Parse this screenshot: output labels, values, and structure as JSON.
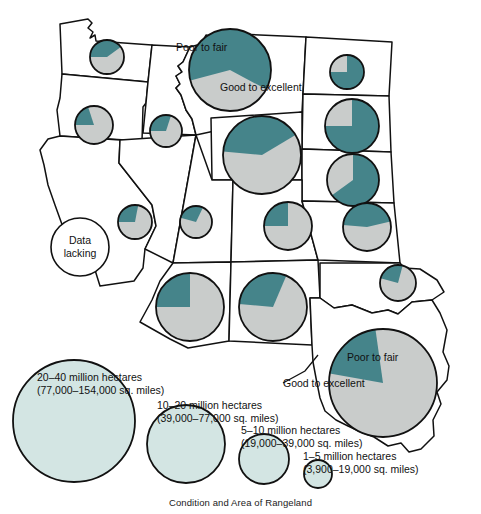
{
  "figure": {
    "caption": "Condition and Area of Rangeland",
    "title_absent": true
  },
  "colors": {
    "good_to_excellent": "#45848a",
    "poor_to_fair": "#c9cccb",
    "legend_circle_fill": "#d3e5e3",
    "outline": "#111111",
    "background": "#ffffff"
  },
  "annotations": {
    "poor_to_fair_montana": "Poor to fair",
    "good_to_excellent_montana": "Good to excellent",
    "poor_to_fair_texas": "Poor to fair",
    "good_to_excellent_texas": "Good to excellent",
    "data_lacking": "Data lacking"
  },
  "legend": {
    "title": "Condition and Area of Rangeland",
    "entries": [
      {
        "id": "legend-20-40",
        "hectares": "20–40 million hectares",
        "sq_miles": "(77,000–154,000 sq. miles)",
        "radius_px": 61
      },
      {
        "id": "legend-10-20",
        "hectares": "10–20 million hectares",
        "sq_miles": "(39,000–77,000 sq. miles)",
        "radius_px": 39
      },
      {
        "id": "legend-5-10",
        "hectares": "5–10 million hectares",
        "sq_miles": "(19,000–39,000 sq. miles)",
        "radius_px": 25
      },
      {
        "id": "legend-1-5",
        "hectares": "1–5 million hectares",
        "sq_miles": "(3,900–19,000 sq. miles)",
        "radius_px": 14
      }
    ]
  },
  "chart_data": {
    "type": "pie",
    "title": "Condition and Area of Rangeland",
    "subtitle": "",
    "xlabel": "",
    "ylabel": "",
    "legend_position": "bottom-left",
    "grid": false,
    "series_names": [
      "Good to excellent",
      "Poor to fair"
    ],
    "value_unit": "percent of state rangeland",
    "size_unit": "million hectares (pie radius encodes rangeland area)",
    "note": "Each pie is placed over a western U.S. state; pie radius encodes total rangeland area, slices encode condition. Nevada shows 'Data lacking'.",
    "states": [
      {
        "name": "Washington",
        "code": "WA",
        "cx": 107,
        "cy": 57,
        "r": 17,
        "good_to_excellent": 40,
        "poor_to_fair": 60,
        "start_angle": 180
      },
      {
        "name": "Oregon",
        "code": "OR",
        "cx": 94,
        "cy": 125,
        "r": 19,
        "good_to_excellent": 20,
        "poor_to_fair": 80,
        "start_angle": 180
      },
      {
        "name": "Idaho",
        "code": "ID",
        "cx": 166,
        "cy": 131,
        "r": 16,
        "good_to_excellent": 30,
        "poor_to_fair": 70,
        "start_angle": 180
      },
      {
        "name": "Montana",
        "code": "MT",
        "cx": 230,
        "cy": 70,
        "r": 41,
        "good_to_excellent": 62,
        "poor_to_fair": 38,
        "start_angle": 165
      },
      {
        "name": "North Dakota",
        "code": "ND",
        "cx": 347,
        "cy": 72,
        "r": 17,
        "good_to_excellent": 75,
        "poor_to_fair": 25,
        "start_angle": 270
      },
      {
        "name": "South Dakota",
        "code": "SD",
        "cx": 352,
        "cy": 126,
        "r": 27,
        "good_to_excellent": 75,
        "poor_to_fair": 25,
        "start_angle": 270
      },
      {
        "name": "Wyoming",
        "code": "WY",
        "cx": 262,
        "cy": 155,
        "r": 39,
        "good_to_excellent": 40,
        "poor_to_fair": 60,
        "start_angle": 185
      },
      {
        "name": "Nebraska",
        "code": "NE",
        "cx": 353,
        "cy": 180,
        "r": 26,
        "good_to_excellent": 65,
        "poor_to_fair": 35,
        "start_angle": 270
      },
      {
        "name": "Nevada",
        "code": "NV",
        "cx": 135,
        "cy": 222,
        "r": 17,
        "good_to_excellent": 28,
        "poor_to_fair": 72,
        "start_angle": 180
      },
      {
        "name": "Utah",
        "code": "UT",
        "cx": 196,
        "cy": 222,
        "r": 16,
        "good_to_excellent": 28,
        "poor_to_fair": 72,
        "start_angle": 195
      },
      {
        "name": "Colorado",
        "code": "CO",
        "cx": 288,
        "cy": 226,
        "r": 24,
        "good_to_excellent": 25,
        "poor_to_fair": 75,
        "start_angle": 180
      },
      {
        "name": "Kansas",
        "code": "KS",
        "cx": 367,
        "cy": 227,
        "r": 24,
        "good_to_excellent": 45,
        "poor_to_fair": 55,
        "start_angle": 185
      },
      {
        "name": "Arizona",
        "code": "AZ",
        "cx": 190,
        "cy": 307,
        "r": 34,
        "good_to_excellent": 25,
        "poor_to_fair": 75,
        "start_angle": 180
      },
      {
        "name": "New Mexico",
        "code": "NM",
        "cx": 273,
        "cy": 307,
        "r": 34,
        "good_to_excellent": 30,
        "poor_to_fair": 70,
        "start_angle": 185
      },
      {
        "name": "Oklahoma",
        "code": "OK",
        "cx": 398,
        "cy": 283,
        "r": 18,
        "good_to_excellent": 25,
        "poor_to_fair": 75,
        "start_angle": 195
      },
      {
        "name": "Texas",
        "code": "TX",
        "cx": 383,
        "cy": 383,
        "r": 54,
        "good_to_excellent": 20,
        "poor_to_fair": 80,
        "start_angle": 190
      },
      {
        "name": "California",
        "code": "CA",
        "cx": 80,
        "cy": 247,
        "r": 29,
        "good_to_excellent": null,
        "poor_to_fair": null,
        "start_angle": 0,
        "status": "Data lacking"
      }
    ]
  }
}
